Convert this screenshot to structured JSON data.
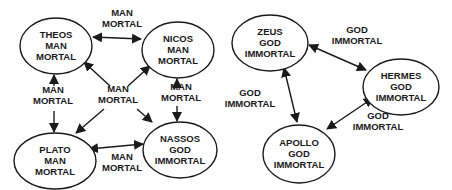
{
  "diagrams": [
    {
      "name": "mortal-network",
      "nodes": [
        {
          "id": "theos",
          "lines": [
            "THEOS",
            "MAN",
            "MORTAL"
          ],
          "cx": 56,
          "cy": 46,
          "rx": 36,
          "ry": 28
        },
        {
          "id": "nicos",
          "lines": [
            "NICOS",
            "MAN",
            "MORTAL"
          ],
          "cx": 178,
          "cy": 50,
          "rx": 36,
          "ry": 28
        },
        {
          "id": "plato",
          "lines": [
            "PLATO",
            "MAN",
            "MORTAL"
          ],
          "cx": 55,
          "cy": 161,
          "rx": 41,
          "ry": 28
        },
        {
          "id": "nassos",
          "lines": [
            "NASSOS",
            "GOD",
            "IMMORTAL"
          ],
          "cx": 180,
          "cy": 150,
          "rx": 37,
          "ry": 28
        }
      ],
      "edge_labels": [
        {
          "id": "theos-nicos",
          "lines": [
            "MAN",
            "MORTAL"
          ],
          "x": 122,
          "y": 16
        },
        {
          "id": "theos-plato",
          "lines": [
            "MAN",
            "MORTAL"
          ],
          "x": 53,
          "y": 93
        },
        {
          "id": "nicos-nassos",
          "lines": [
            "MAN",
            "MORTAL"
          ],
          "x": 181,
          "y": 90
        },
        {
          "id": "center",
          "lines": [
            "MAN",
            "MORTAL"
          ],
          "x": 118,
          "y": 92
        },
        {
          "id": "plato-nassos",
          "lines": [
            "MAN",
            "MORTAL"
          ],
          "x": 122,
          "y": 160
        }
      ]
    },
    {
      "name": "immortal-network",
      "nodes": [
        {
          "id": "zeus",
          "lines": [
            "ZEUS",
            "GOD",
            "IMMORTAL"
          ],
          "cx": 270,
          "cy": 43,
          "rx": 38,
          "ry": 28
        },
        {
          "id": "hermes",
          "lines": [
            "HERMES",
            "GOD",
            "IMMORTAL"
          ],
          "cx": 401,
          "cy": 87,
          "rx": 38,
          "ry": 28
        },
        {
          "id": "apollo",
          "lines": [
            "APOLLO",
            "GOD",
            "IMMORTAL"
          ],
          "cx": 299,
          "cy": 154,
          "rx": 36,
          "ry": 29
        }
      ],
      "edge_labels": [
        {
          "id": "zeus-hermes",
          "lines": [
            "GOD",
            "IMMORTAL"
          ],
          "x": 357,
          "y": 33
        },
        {
          "id": "zeus-apollo",
          "lines": [
            "GOD",
            "IMMORTAL"
          ],
          "x": 250,
          "y": 96
        },
        {
          "id": "hermes-apollo",
          "lines": [
            "GOD",
            "IMMORTAL"
          ],
          "x": 378,
          "y": 119
        }
      ]
    }
  ]
}
